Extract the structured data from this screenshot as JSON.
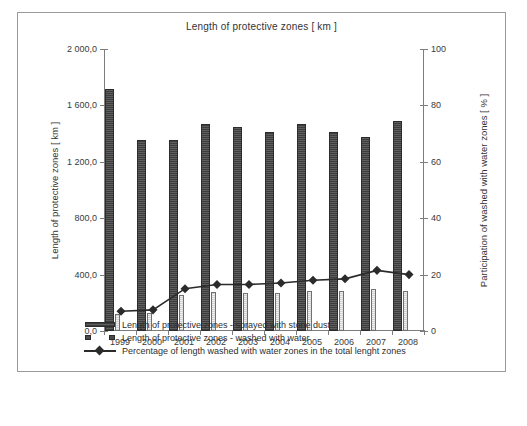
{
  "chart_data": {
    "type": "bar",
    "title": "Length of protective zones  [ km ]",
    "categories": [
      "1999",
      "2000",
      "2001",
      "2002",
      "2003",
      "2004",
      "2005",
      "2006",
      "2007",
      "2008"
    ],
    "ylabel": "Length of protective zones  [ km ]",
    "ylabel_right": "Participation of washed with water zones [ % ]",
    "xlabel": "",
    "ylim": [
      0,
      2000
    ],
    "ylim_right": [
      0,
      100
    ],
    "yticks": [
      "0,0",
      "400,0",
      "800,0",
      "1 200,0",
      "1 600,0",
      "2 000,0"
    ],
    "ytick_values": [
      0,
      400,
      800,
      1200,
      1600,
      2000
    ],
    "yticks_right": [
      "0",
      "20",
      "40",
      "60",
      "80",
      "100"
    ],
    "ytick_values_right": [
      0,
      20,
      40,
      60,
      80,
      100
    ],
    "grid": false,
    "legend_position": "bottom",
    "series": [
      {
        "name": "Length of protective zones  - sprayed with  stone dust",
        "type": "bar",
        "axis": "left",
        "color": "#4a4a4a",
        "values": [
          1716,
          1355,
          1355,
          1468,
          1447,
          1411,
          1468,
          1411,
          1376,
          1489
        ]
      },
      {
        "name": "Length of protective zones  - washed with water",
        "type": "bar",
        "axis": "left",
        "color": "#d8d8d8",
        "values": [
          120,
          128,
          255,
          277,
          270,
          270,
          284,
          284,
          298,
          284
        ]
      },
      {
        "name": "Percentage of length washed with water zones in the total lenght zones",
        "type": "line",
        "axis": "right",
        "color": "#2b2b2b",
        "values": [
          7.0,
          7.5,
          15.0,
          16.5,
          16.5,
          17.0,
          18.0,
          18.5,
          21.5,
          20.0
        ]
      }
    ]
  }
}
